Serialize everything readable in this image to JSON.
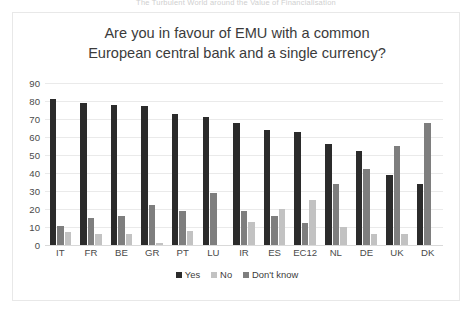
{
  "running_header": "The Turbulent World around the Value of Financialisation",
  "chart_data": {
    "type": "bar",
    "title": "Are you in favour of EMU with a common European central bank and a single currency?",
    "title_lines": [
      "Are you in favour of EMU with a common",
      "European central bank and a single currency?"
    ],
    "xlabel": "",
    "ylabel": "",
    "ylim": [
      0,
      90
    ],
    "yticks": [
      90,
      80,
      70,
      60,
      50,
      40,
      30,
      20,
      10,
      0
    ],
    "grid": true,
    "legend_position": "bottom",
    "categories": [
      "IT",
      "FR",
      "BE",
      "GR",
      "PT",
      "LU",
      "IR",
      "ES",
      "EC12",
      "NL",
      "DE",
      "UK",
      "DK"
    ],
    "series": [
      {
        "name": "Yes",
        "color": "#2b2b2b",
        "values": [
          81,
          79,
          78,
          77,
          73,
          71,
          68,
          64,
          63,
          56,
          52,
          39,
          34
        ]
      },
      {
        "name": "No",
        "color": "#c2c2c2",
        "values": [
          10.5,
          15,
          16,
          22,
          19,
          29,
          19,
          16,
          12,
          34,
          42,
          55,
          68
        ]
      },
      {
        "name": "Don't know",
        "color": "#7e7e7e",
        "values": [
          7.5,
          6,
          6,
          1,
          8,
          0,
          13,
          20,
          25,
          10,
          6,
          6,
          0
        ]
      }
    ],
    "bar_render_order": [
      "Yes",
      "No",
      "Don't know"
    ],
    "bar_render_colors": [
      "#2b2b2b",
      "#7e7e7e",
      "#c2c2c2"
    ]
  }
}
